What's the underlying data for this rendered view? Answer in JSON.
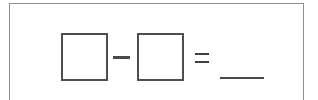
{
  "worksheet": {
    "problem_type": "subtraction-equation",
    "expression": "□ − □ = ___",
    "frame": {
      "name": "problem-frame",
      "border_color": "#8f8f8f",
      "background_color": "#ffffff"
    },
    "operands": [
      {
        "id": "operand-box-1",
        "label": "",
        "placeholder": "",
        "shape": "empty-square-box",
        "border_color": "#4f4f4f"
      },
      {
        "id": "operand-box-2",
        "label": "",
        "placeholder": "",
        "shape": "empty-square-box",
        "border_color": "#4f4f4f"
      }
    ],
    "operators": [
      {
        "id": "minus-operator",
        "symbol": "−",
        "name": "minus-sign",
        "color": "#4a4a4a"
      },
      {
        "id": "equals-operator",
        "symbol": "=",
        "name": "equals-sign",
        "color": "#3f3f3f"
      }
    ],
    "answer_blank": {
      "id": "answer-blank",
      "value": "",
      "placeholder": "",
      "rule": "_____",
      "color": "#4a4a4a"
    }
  }
}
